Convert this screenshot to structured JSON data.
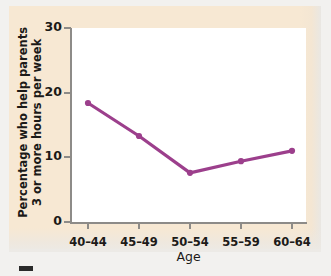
{
  "figure": {
    "background_color": "#f7e8d3",
    "plot_background_color": "#ffffff",
    "axis_color": "#8d8b88"
  },
  "chart_data": {
    "type": "line",
    "title": "",
    "subtitle": "",
    "xlabel": "Age",
    "ylabel": "Percentage who help parents 3 or more hours per week",
    "ylabel_line1": "Percentage who help parents",
    "ylabel_line2": "3 or more hours per week",
    "categories": [
      "40–44",
      "45–49",
      "50–54",
      "55–59",
      "60–64"
    ],
    "values": [
      18.4,
      13.3,
      7.6,
      9.4,
      11.0
    ],
    "yticks": [
      0,
      10,
      20,
      30
    ],
    "ytick_labels": [
      "0",
      "10",
      "20",
      "30"
    ],
    "ylim": [
      0,
      30
    ],
    "grid": false,
    "legend": false,
    "legend_position": "none",
    "series": [
      {
        "name": "Percentage who help parents 3 or more hours per week",
        "color": "#9c3f8c",
        "marker": "circle",
        "values": [
          18.4,
          13.3,
          7.6,
          9.4,
          11.0
        ]
      }
    ]
  }
}
